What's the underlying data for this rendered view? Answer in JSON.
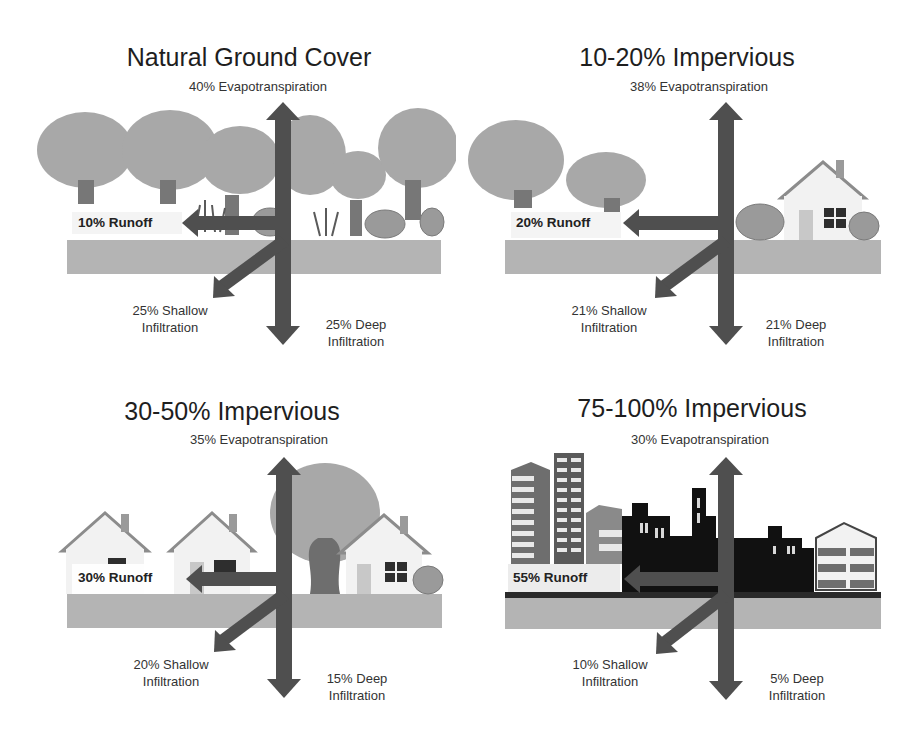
{
  "colors": {
    "arrow": "#4f4f4f",
    "ground": "#b4b4b4",
    "foliage": "#a8a8a8",
    "trunk": "#777777",
    "shrub": "#9a9a9a",
    "house_wall": "#f2f2f2",
    "house_roof": "#8c8c8c",
    "building_dark": "#111111",
    "building_mid": "#6e6e6e"
  },
  "panels": [
    {
      "title": "Natural Ground Cover",
      "evapotranspiration": "40% Evapotranspiration",
      "runoff": "10% Runoff",
      "shallow_line1": "25% Shallow",
      "shallow_line2": "Infiltration",
      "deep_line1": "25% Deep",
      "deep_line2": "Infiltration"
    },
    {
      "title": "10-20% Impervious",
      "evapotranspiration": "38% Evapotranspiration",
      "runoff": "20% Runoff",
      "shallow_line1": "21% Shallow",
      "shallow_line2": "Infiltration",
      "deep_line1": "21% Deep",
      "deep_line2": "Infiltration"
    },
    {
      "title": "30-50% Impervious",
      "evapotranspiration": "35% Evapotranspiration",
      "runoff": "30% Runoff",
      "shallow_line1": "20% Shallow",
      "shallow_line2": "Infiltration",
      "deep_line1": "15% Deep",
      "deep_line2": "Infiltration"
    },
    {
      "title": "75-100% Impervious",
      "evapotranspiration": "30% Evapotranspiration",
      "runoff": "55% Runoff",
      "shallow_line1": "10% Shallow",
      "shallow_line2": "Infiltration",
      "deep_line1": "5% Deep",
      "deep_line2": "Infiltration"
    }
  ]
}
